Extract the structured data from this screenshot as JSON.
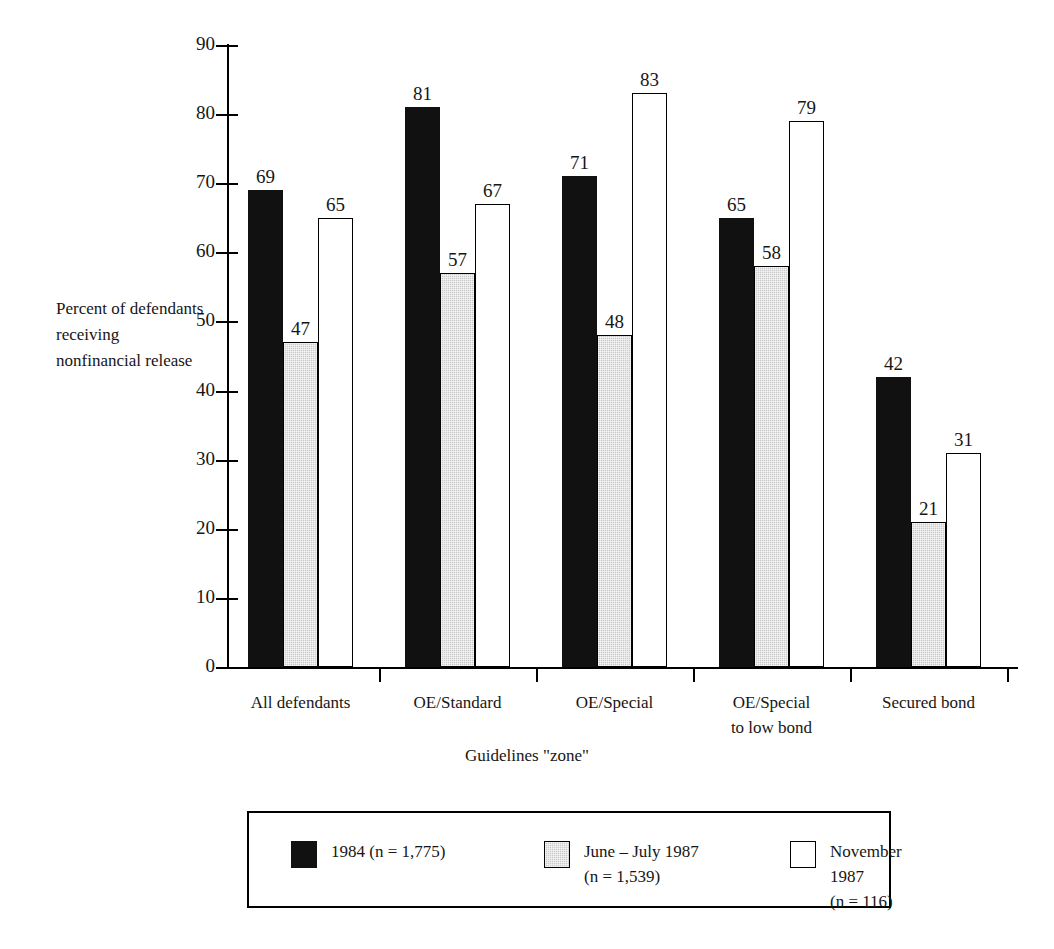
{
  "chart_data": {
    "type": "bar",
    "title": "",
    "xlabel": "Guidelines \"zone\"",
    "ylabel": "Percent of\ndefendants\nreceiving\nnonfinancial\nrelease",
    "categories": [
      "All defendants",
      "OE/Standard",
      "OE/Special",
      "OE/Special\nto low bond",
      "Secured bond"
    ],
    "series": [
      {
        "name": "1984 (n = 1,775)",
        "legend_label": "1984 (n = 1,775)",
        "color": "#111111",
        "style": "solid-black",
        "values": [
          69,
          81,
          71,
          65,
          42
        ]
      },
      {
        "name": "June – July 1987 (n = 1,539)",
        "legend_label": "June – July 1987\n(n = 1,539)",
        "color": "#cacaca",
        "style": "stippled-gray",
        "values": [
          47,
          57,
          48,
          58,
          21
        ]
      },
      {
        "name": "November 1987 (n = 116)",
        "legend_label": "November 1987\n(n = 116)",
        "color": "#ffffff",
        "style": "open-white",
        "values": [
          65,
          67,
          83,
          79,
          31
        ]
      }
    ],
    "ylim": [
      0,
      90
    ],
    "ytick_values": [
      0,
      10,
      20,
      30,
      40,
      50,
      60,
      70,
      80,
      90
    ],
    "ytick_labels": [
      "0",
      "10",
      "20",
      "30",
      "40",
      "50",
      "60",
      "70",
      "80",
      "90"
    ],
    "grid": false,
    "legend_position": "bottom",
    "value_labels": true
  },
  "axis": {
    "y_title": "Percent of\ndefendants\nreceiving\nnonfinancial\nrelease",
    "x_title": "Guidelines \"zone\""
  }
}
